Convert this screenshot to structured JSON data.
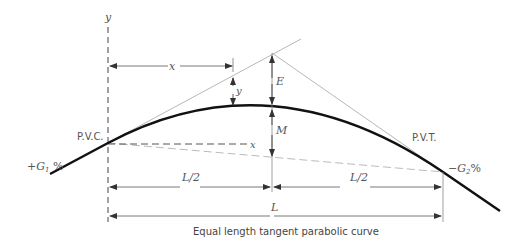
{
  "diagram": {
    "caption": "Equal length tangent parabolic curve",
    "axis_labels": {
      "y_axis": "y",
      "x_axis": "x"
    },
    "points": {
      "pvc": "P.V.C.",
      "pvt": "P.V.T."
    },
    "grades": {
      "g1": "+G",
      "g1_sub": "1",
      "g1_pct": " %",
      "g2": "−G",
      "g2_sub": "2",
      "g2_pct": "%"
    },
    "dimensions": {
      "x_offset": "x",
      "y_offset": "y",
      "external_distance": "E",
      "middle_ordinate": "M",
      "half_length_left": "L/2",
      "half_length_right": "L/2",
      "length": "L"
    },
    "colors": {
      "curve": "#111111",
      "tangent": "#b8b8b8",
      "dim_line": "#777777",
      "chord": "#bbbbbb"
    }
  }
}
